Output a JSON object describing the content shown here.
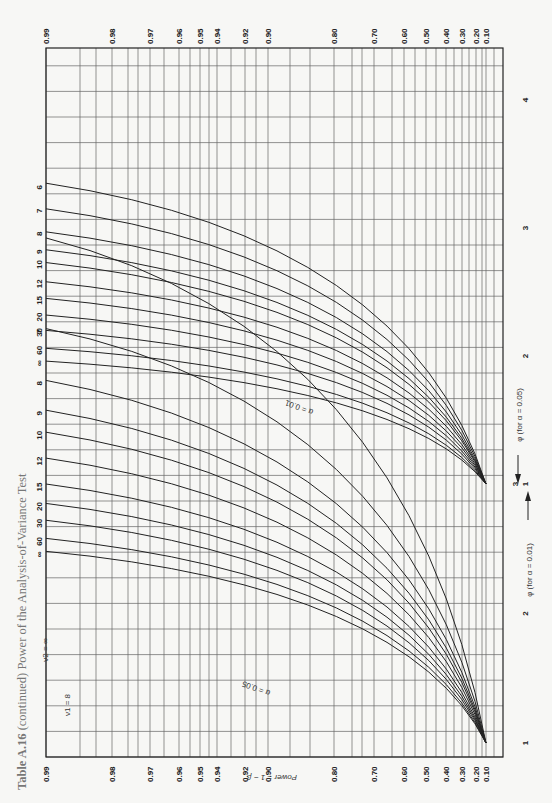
{
  "chart_data": {
    "type": "line",
    "title": "Table A.16 (continued) Power of the Analysis-of-Variance Test",
    "title_prefix": "Table A.16",
    "title_rest": "(continued) Power of the Analysis-of-Variance Test",
    "orientation": "page rotated 90° counter-clockwise",
    "nu1_label": "ν1 = 8",
    "nu2_label": "ν2 = ∞",
    "ylabel": "Power = 1 − β",
    "xlabel_alpha_001": "φ (for α = 0.01)",
    "xlabel_alpha_005": "φ (for α = 0.05)",
    "power_ticks": [
      "0.99",
      "0.98",
      "0.97",
      "0.96",
      "0.95",
      "0.94",
      "0.92",
      "0.90",
      "0.80",
      "0.70",
      "0.60",
      "0.50",
      "0.40",
      "0.30",
      "0.20",
      "0.10"
    ],
    "phi_ticks_alpha_001": [
      "1",
      "2",
      "3"
    ],
    "phi_ticks_alpha_005": [
      "1",
      "2",
      "3",
      "4"
    ],
    "grid": true,
    "families": [
      {
        "name": "α = 0.05",
        "label": "α = 0.05",
        "nu2": [
          "6",
          "7",
          "8",
          "9",
          "10",
          "12",
          "15",
          "20",
          "30",
          "60",
          "∞"
        ],
        "phi_at_power_0_10": 1.0,
        "approx_phi_at_power_0_99": [
          3.35,
          3.15,
          2.97,
          2.83,
          2.73,
          2.58,
          2.45,
          2.32,
          2.2,
          2.06,
          1.96
        ]
      },
      {
        "name": "α = 0.01",
        "label": "α = 0.01",
        "nu2": [
          "6",
          "7",
          "8",
          "9",
          "10",
          "12",
          "15",
          "20",
          "30",
          "60",
          "∞"
        ],
        "phi_at_power_0_10": 1.0,
        "approx_phi_at_power_0_99": [
          4.9,
          4.2,
          3.8,
          3.57,
          3.4,
          3.2,
          3.0,
          2.85,
          2.72,
          2.58,
          2.48
        ]
      }
    ],
    "curve_labels_left": [
      "6",
      "7",
      "8",
      "9",
      "10",
      "12",
      "15",
      "20",
      "30",
      "60",
      "∞"
    ],
    "curve_labels_top": [
      "7",
      "8",
      "9",
      "10",
      "12",
      "15",
      "20",
      "30",
      "60",
      "∞"
    ]
  }
}
